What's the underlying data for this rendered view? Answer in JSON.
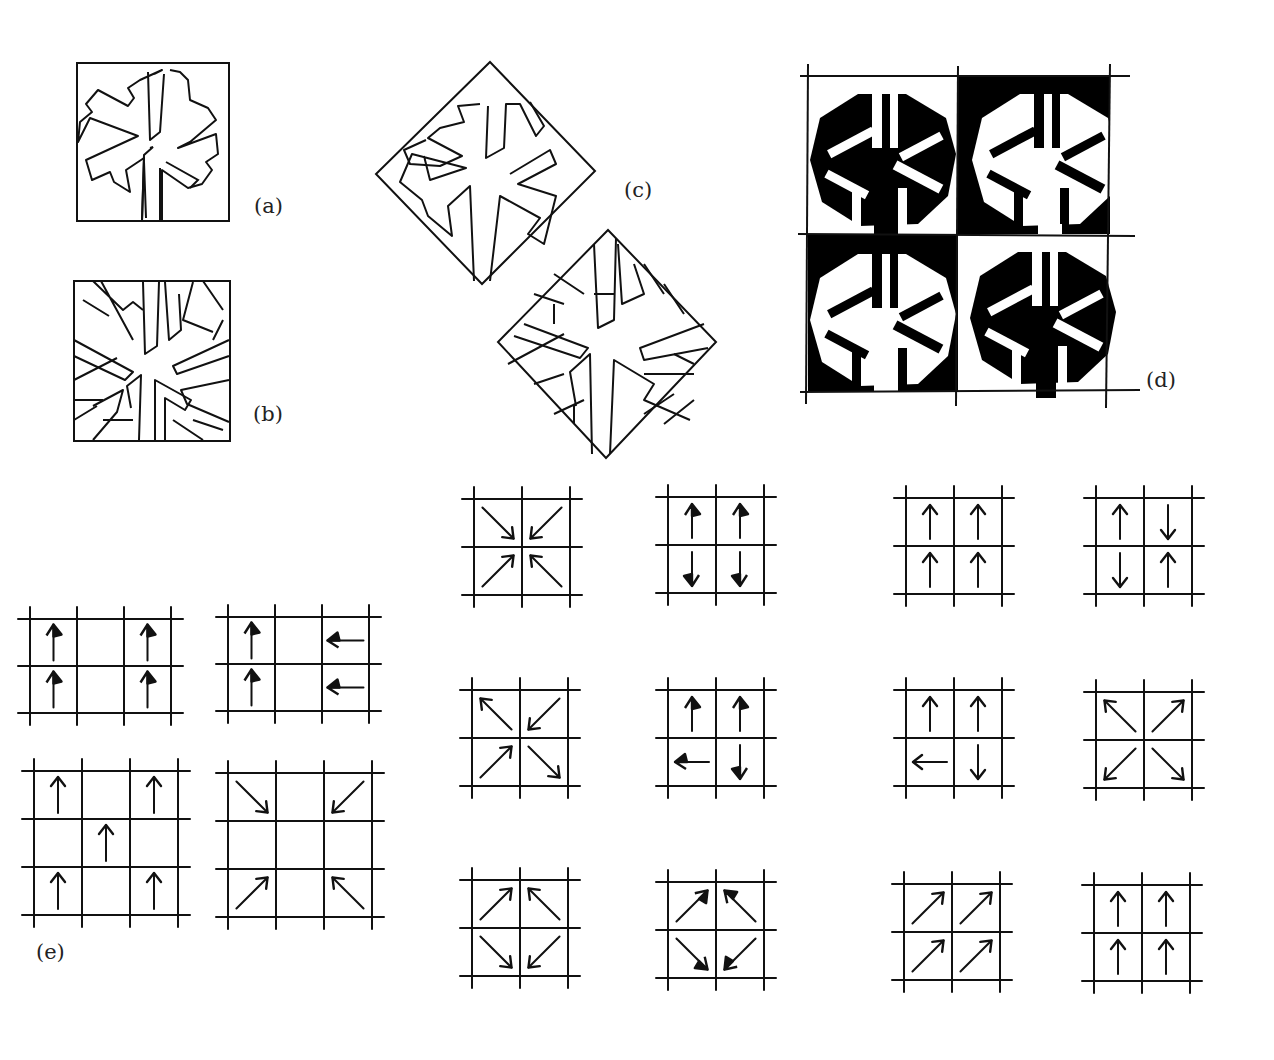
{
  "figure": {
    "labels": {
      "a": "(a)",
      "b": "(b)",
      "c": "(c)",
      "d": "(d)",
      "e": "(e)"
    },
    "panels": {
      "a": {
        "description": "snowflake motif outline in square tile"
      },
      "b": {
        "description": "snowflake motif with background subdivided into cells"
      },
      "c": {
        "description": "two rotated diamond tiles: snowflake outline, and snowflake with subdivided background"
      },
      "d": {
        "description": "2x2 checkerboard of snowflake tiles, alternating black and white figure/ground",
        "cells": [
          {
            "row": 0,
            "col": 0,
            "background": "#ffffff",
            "figure": "#000000"
          },
          {
            "row": 0,
            "col": 1,
            "background": "#000000",
            "figure": "#ffffff"
          },
          {
            "row": 1,
            "col": 0,
            "background": "#000000",
            "figure": "#ffffff"
          },
          {
            "row": 1,
            "col": 1,
            "background": "#ffffff",
            "figure": "#000000"
          }
        ]
      }
    },
    "arrow_grids_e": [
      {
        "cols": 3,
        "rows": 2,
        "style": "solid-head",
        "arrows": [
          {
            "r": 0,
            "c": 0,
            "dir": "up"
          },
          {
            "r": 0,
            "c": 2,
            "dir": "up"
          },
          {
            "r": 1,
            "c": 0,
            "dir": "up"
          },
          {
            "r": 1,
            "c": 2,
            "dir": "up"
          }
        ]
      },
      {
        "cols": 3,
        "rows": 2,
        "style": "solid-head",
        "arrows": [
          {
            "r": 0,
            "c": 0,
            "dir": "right"
          },
          {
            "r": 0,
            "c": 2,
            "dir": "left"
          },
          {
            "r": 1,
            "c": 0,
            "dir": "right"
          },
          {
            "r": 1,
            "c": 2,
            "dir": "left"
          }
        ]
      },
      {
        "cols": 3,
        "rows": 3,
        "style": "open",
        "arrows": [
          {
            "r": 0,
            "c": 0,
            "dir": "up"
          },
          {
            "r": 0,
            "c": 2,
            "dir": "up"
          },
          {
            "r": 1,
            "c": 1,
            "dir": "up"
          },
          {
            "r": 2,
            "c": 0,
            "dir": "up"
          },
          {
            "r": 2,
            "c": 2,
            "dir": "up"
          }
        ]
      },
      {
        "cols": 3,
        "rows": 3,
        "style": "open",
        "arrows": [
          {
            "r": 0,
            "c": 0,
            "dir": "down-right"
          },
          {
            "r": 0,
            "c": 2,
            "dir": "down-left"
          },
          {
            "r": 2,
            "c": 0,
            "dir": "up-right"
          },
          {
            "r": 2,
            "c": 2,
            "dir": "up-left"
          }
        ]
      }
    ],
    "arrow_grids_2x2": [
      {
        "id": "m1",
        "style": "open",
        "arrows": [
          "down-right",
          "down-left",
          "up-right",
          "up-left"
        ]
      },
      {
        "id": "m2",
        "style": "solid-head",
        "arrows": [
          "up",
          "up",
          "down",
          "down"
        ]
      },
      {
        "id": "m3",
        "style": "open",
        "arrows": [
          "up-left",
          "down-left",
          "up-right",
          "down-right"
        ]
      },
      {
        "id": "m4",
        "style": "solid-head",
        "arrows": [
          "up",
          "right",
          "left",
          "down"
        ]
      },
      {
        "id": "m5",
        "style": "open",
        "arrows": [
          "up-right",
          "up-left",
          "down-right",
          "down-left"
        ]
      },
      {
        "id": "m6",
        "style": "solid-head",
        "arrows": [
          "up-right",
          "up-left",
          "down-right",
          "down-left"
        ]
      },
      {
        "id": "r1",
        "style": "open",
        "arrows": [
          "up",
          "up",
          "up",
          "up"
        ]
      },
      {
        "id": "r2",
        "style": "open",
        "arrows": [
          "up",
          "down",
          "down",
          "up"
        ]
      },
      {
        "id": "r3",
        "style": "open",
        "arrows": [
          "up",
          "right",
          "left",
          "down"
        ]
      },
      {
        "id": "r4",
        "style": "open",
        "arrows": [
          "up-left",
          "up-right",
          "down-left",
          "down-right"
        ]
      },
      {
        "id": "r5",
        "style": "open",
        "arrows": [
          "up-right",
          "up-right",
          "up-right",
          "up-right"
        ]
      },
      {
        "id": "r6",
        "style": "open",
        "arrows": [
          "up",
          "right",
          "right",
          "up"
        ]
      }
    ],
    "colors": {
      "ink": "#111111",
      "paper": "#ffffff"
    }
  }
}
